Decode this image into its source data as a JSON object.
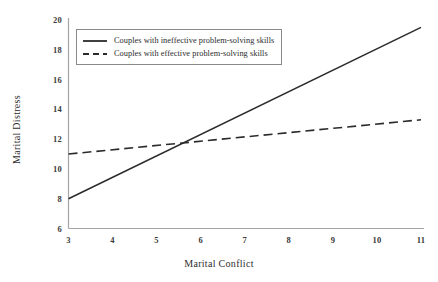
{
  "chart_data": {
    "type": "line",
    "title": "",
    "xlabel": "Marital Conflict",
    "ylabel": "Marital Distress",
    "xlim": [
      3,
      11
    ],
    "ylim": [
      6,
      20
    ],
    "xticks": [
      "3",
      "4",
      "5",
      "6",
      "7",
      "8",
      "9",
      "10",
      "11"
    ],
    "yticks": [
      "6",
      "8",
      "10",
      "12",
      "14",
      "16",
      "18",
      "20"
    ],
    "grid": false,
    "legend_position": "upper left",
    "series": [
      {
        "name": "Couples with ineffective problem-solving skills",
        "style": "solid",
        "color": "#2b2b2b",
        "x": [
          3,
          11
        ],
        "values": [
          8.0,
          19.5
        ]
      },
      {
        "name": "Couples with effective problem-solving skills",
        "style": "dashed",
        "color": "#2b2b2b",
        "x": [
          3,
          11
        ],
        "values": [
          11.0,
          13.3
        ]
      }
    ],
    "annotations": []
  },
  "figure": {
    "background": "#ffffff",
    "axis_color": "#9a9a9a",
    "line_color": "#2b2b2b"
  }
}
